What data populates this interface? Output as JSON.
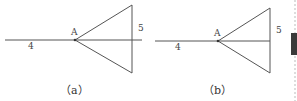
{
  "figures": [
    {
      "id": "a",
      "caption": "（a）",
      "labels": {
        "apex": "A",
        "left_segment": "4",
        "right_segment": "5"
      },
      "line_extends_past_triangle": true
    },
    {
      "id": "b",
      "caption": "（b）",
      "labels": {
        "apex": "A",
        "left_segment": "4",
        "right_segment": "5"
      },
      "line_extends_past_triangle": false
    }
  ],
  "colors": {
    "line": "#555555",
    "text": "#333333",
    "side_bar": "#3a3a3a",
    "dashed_divider": "#bbbbbb"
  }
}
